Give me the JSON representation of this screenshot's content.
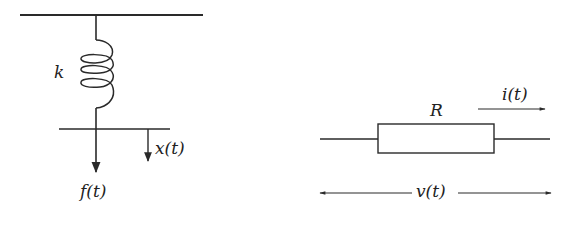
{
  "colors": {
    "stroke": "#2a2a2a",
    "background": "#ffffff"
  },
  "spring_system": {
    "spring_label": "k",
    "displacement_label": "x(t)",
    "force_label": "f(t)"
  },
  "resistor_circuit": {
    "resistor_label": "R",
    "current_label": "i(t)",
    "voltage_label": "v(t)"
  }
}
